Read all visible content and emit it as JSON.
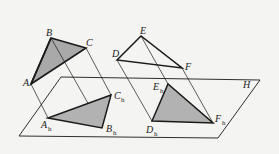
{
  "diagram": {
    "colors": {
      "background": "#f4f4f2",
      "stroke": "#1a1a1a",
      "fill": "#a9a9a9"
    },
    "plane": {
      "label": "H",
      "points": [
        [
          61,
          77
        ],
        [
          260,
          80
        ],
        [
          218,
          138
        ],
        [
          19,
          136
        ]
      ]
    },
    "triangle_abc": {
      "vertices": {
        "A": [
          31,
          84
        ],
        "B": [
          51,
          38
        ],
        "C": [
          86,
          48
        ]
      },
      "labels": {
        "A": "A",
        "B": "B",
        "C": "C"
      }
    },
    "triangle_abc_projection": {
      "vertices": {
        "Ah": [
          48,
          118
        ],
        "Bh": [
          102,
          128
        ],
        "Ch": [
          111,
          95
        ]
      },
      "labels": {
        "Ah": "A",
        "Bh": "B",
        "Ch": "C",
        "sub": "h"
      }
    },
    "triangle_def": {
      "vertices": {
        "D": [
          117,
          60
        ],
        "E": [
          141,
          36
        ],
        "F": [
          182,
          68
        ]
      },
      "labels": {
        "D": "D",
        "E": "E",
        "F": "F"
      }
    },
    "triangle_def_projection": {
      "vertices": {
        "Dh": [
          152,
          121
        ],
        "Eh": [
          168,
          84
        ],
        "Fh": [
          213,
          123
        ]
      },
      "labels": {
        "Dh": "D",
        "Eh": "E",
        "Fh": "F",
        "sub": "h"
      }
    }
  }
}
